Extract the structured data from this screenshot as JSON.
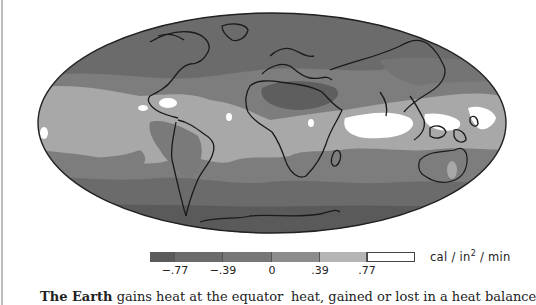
{
  "figure": {
    "legend": {
      "units_prefix": "cal / in",
      "units_exp": "2",
      "units_suffix": " / min",
      "colors": [
        "#5a5a5a",
        "#6b6b6b",
        "#7a7a7a",
        "#9a9a9a",
        "#bdbdbd",
        "#ffffff"
      ],
      "segment_widths": [
        25,
        48,
        49,
        48,
        47,
        48
      ],
      "tick_labels": [
        "−.77",
        "−.39",
        "0",
        ".39",
        ".77"
      ],
      "tick_positions": [
        175,
        223,
        272,
        320,
        367
      ]
    },
    "palette": {
      "ocean_border": "#222222",
      "coast": "#1a1a1a",
      "darkest": "#5a5a5a",
      "dark": "#6b6b6b",
      "mid": "#7d7d7d",
      "light": "#a5a5a5",
      "lighter": "#bdbdbd",
      "white": "#ffffff"
    }
  },
  "caption": {
    "left_bold": "The Earth",
    "left_rest": " gains heat at the equator",
    "right": "heat, gained or lost in a heat balance"
  }
}
